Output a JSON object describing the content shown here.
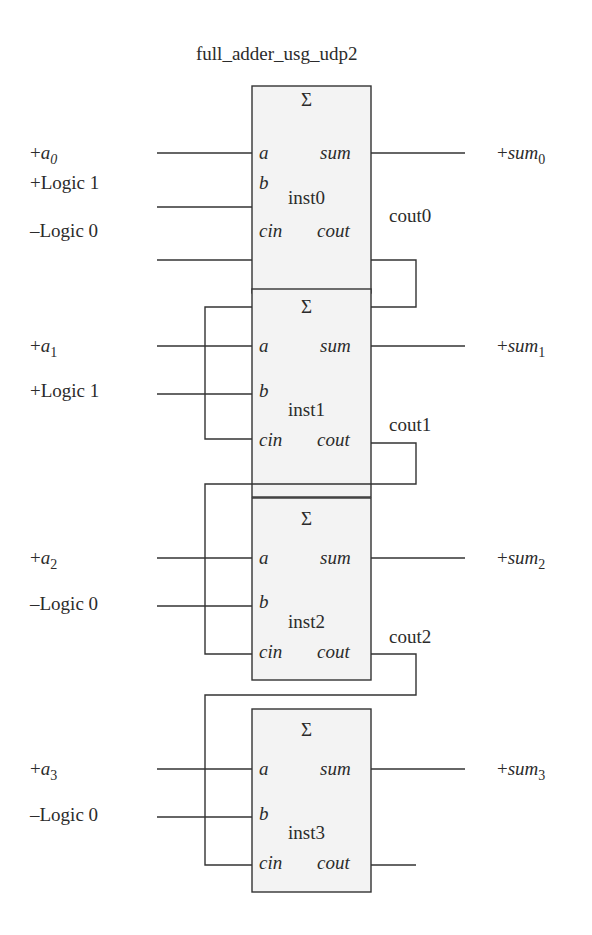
{
  "diagram": {
    "title": "full_adder_usg_udp2",
    "colors": {
      "line": "#333333",
      "text": "#2b2b2b",
      "box_fill": "#f3f3f3",
      "background": "#ffffff"
    },
    "block_symbol": "Σ",
    "port_labels": {
      "a": "a",
      "b": "b",
      "cin": "cin",
      "sum": "sum",
      "cout": "cout"
    },
    "stages": [
      {
        "instance": "inst0",
        "input_a": {
          "sign": "+",
          "name": "a",
          "index": "0"
        },
        "input_b": "+Logic 1",
        "input_cin": "–Logic 0",
        "output_sum": {
          "sign": "+",
          "name": "sum",
          "index": "0"
        },
        "carry_out": "cout0"
      },
      {
        "instance": "inst1",
        "input_a": {
          "sign": "+",
          "name": "a",
          "index": "1"
        },
        "input_b": "+Logic 1",
        "input_cin": "cout0",
        "output_sum": {
          "sign": "+",
          "name": "sum",
          "index": "1"
        },
        "carry_out": "cout1"
      },
      {
        "instance": "inst2",
        "input_a": {
          "sign": "+",
          "name": "a",
          "index": "2"
        },
        "input_b": "–Logic 0",
        "input_cin": "cout1",
        "output_sum": {
          "sign": "+",
          "name": "sum",
          "index": "2"
        },
        "carry_out": "cout2"
      },
      {
        "instance": "inst3",
        "input_a": {
          "sign": "+",
          "name": "a",
          "index": "3"
        },
        "input_b": "–Logic 0",
        "input_cin": "cout2",
        "output_sum": {
          "sign": "+",
          "name": "sum",
          "index": "3"
        },
        "carry_out": ""
      }
    ]
  }
}
